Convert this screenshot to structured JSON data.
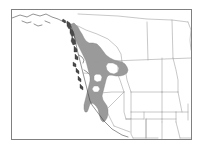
{
  "figure": {
    "type": "range-map",
    "title": "",
    "background_color": "#ffffff",
    "frame": {
      "color": "#808080",
      "x": 11,
      "y": 9,
      "width": 181,
      "height": 131,
      "line_width": 1
    }
  },
  "legend": {
    "visible": false,
    "entries": [
      {
        "label": "",
        "color": "#9a9a9a",
        "meaning": "shaded distribution range"
      }
    ]
  },
  "map_data": {
    "type": "choropleth-range",
    "region": "western North America",
    "projection_note": "",
    "colors": {
      "range_fill": "#9a9a9a",
      "range_outline": "#7d7d7d",
      "coastline": "#3a3a3a",
      "political_border": "#9b9b9b",
      "island_fill": "#4a4a4a",
      "land_fill": "#ffffff",
      "frame": "#808080"
    },
    "labels": [],
    "annotations": [],
    "tick_labels": [],
    "shaded_area_description": "continuous gray band from southeast Alaska panhandle and coastal British Columbia south through Washington, Oregon and the Sierra Nevada of California, with unshaded white interior gaps in the Columbia Basin and Willamette lowlands"
  }
}
